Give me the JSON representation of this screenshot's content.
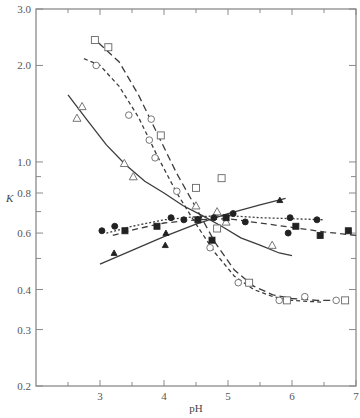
{
  "chart_data": {
    "type": "scatter",
    "title": "",
    "xlabel": "pH",
    "ylabel": "K",
    "xlim": [
      2,
      7
    ],
    "ylim": [
      0.2,
      3.0
    ],
    "yscale": "log",
    "grid": false,
    "legend": "none",
    "x_ticks": [
      3,
      4,
      5,
      6,
      7
    ],
    "x_minor_ticks": [
      2.5,
      3.5,
      4.5,
      5.5,
      6.5
    ],
    "y_ticks": [
      0.2,
      0.3,
      0.4,
      0.6,
      0.8,
      1.0,
      2.0,
      3.0
    ],
    "y_tick_labels": [
      "0.2",
      "0.3",
      "0.4",
      "0.6",
      "0.8",
      "1.0",
      "2.0",
      "3.0"
    ],
    "y_minor_ticks": [
      0.5,
      0.7,
      0.9
    ],
    "series": [
      {
        "name": "open-squares",
        "marker": "square-open",
        "points": [
          [
            2.92,
            2.4
          ],
          [
            3.13,
            2.28
          ],
          [
            3.95,
            1.21
          ],
          [
            4.5,
            0.83
          ],
          [
            4.9,
            0.89
          ],
          [
            4.83,
            0.62
          ],
          [
            5.33,
            0.42
          ],
          [
            5.92,
            0.37
          ],
          [
            6.83,
            0.37
          ]
        ]
      },
      {
        "name": "open-circles",
        "marker": "circle-open",
        "points": [
          [
            2.94,
            2.0
          ],
          [
            3.45,
            1.4
          ],
          [
            3.8,
            1.36
          ],
          [
            3.77,
            1.17
          ],
          [
            3.86,
            1.03
          ],
          [
            4.2,
            0.81
          ],
          [
            4.72,
            0.54
          ],
          [
            5.16,
            0.42
          ],
          [
            5.8,
            0.37
          ],
          [
            6.2,
            0.38
          ],
          [
            6.69,
            0.37
          ]
        ]
      },
      {
        "name": "open-triangles",
        "marker": "triangle-open",
        "points": [
          [
            2.64,
            1.37
          ],
          [
            2.72,
            1.49
          ],
          [
            3.38,
            0.99
          ],
          [
            3.52,
            0.9
          ],
          [
            4.5,
            0.73
          ],
          [
            4.83,
            0.7
          ],
          [
            4.97,
            0.65
          ],
          [
            5.69,
            0.55
          ]
        ]
      },
      {
        "name": "filled-circles",
        "marker": "circle-filled",
        "points": [
          [
            3.03,
            0.61
          ],
          [
            3.23,
            0.63
          ],
          [
            4.11,
            0.67
          ],
          [
            4.31,
            0.66
          ],
          [
            4.78,
            0.67
          ],
          [
            5.08,
            0.69
          ],
          [
            5.27,
            0.65
          ],
          [
            5.97,
            0.67
          ],
          [
            6.39,
            0.66
          ],
          [
            5.94,
            0.6
          ]
        ]
      },
      {
        "name": "filled-squares",
        "marker": "square-filled",
        "points": [
          [
            3.39,
            0.61
          ],
          [
            3.89,
            0.63
          ],
          [
            4.53,
            0.66
          ],
          [
            4.75,
            0.57
          ],
          [
            4.97,
            0.67
          ],
          [
            6.06,
            0.63
          ],
          [
            6.44,
            0.59
          ],
          [
            6.88,
            0.61
          ]
        ]
      },
      {
        "name": "filled-triangles",
        "marker": "triangle-filled",
        "points": [
          [
            3.22,
            0.52
          ],
          [
            4.03,
            0.6
          ],
          [
            4.02,
            0.55
          ],
          [
            5.81,
            0.76
          ]
        ]
      }
    ],
    "curves": [
      {
        "name": "fit-open-squares",
        "style": "long-dash",
        "points": [
          [
            2.98,
            2.35
          ],
          [
            3.3,
            2.05
          ],
          [
            3.6,
            1.62
          ],
          [
            3.9,
            1.22
          ],
          [
            4.2,
            0.92
          ],
          [
            4.5,
            0.72
          ],
          [
            4.8,
            0.56
          ],
          [
            5.1,
            0.46
          ],
          [
            5.4,
            0.41
          ],
          [
            5.7,
            0.385
          ],
          [
            6.0,
            0.375
          ],
          [
            6.4,
            0.37
          ],
          [
            6.7,
            0.37
          ]
        ]
      },
      {
        "name": "fit-open-circles",
        "style": "short-dash",
        "points": [
          [
            2.75,
            2.1
          ],
          [
            3.0,
            2.0
          ],
          [
            3.3,
            1.72
          ],
          [
            3.6,
            1.38
          ],
          [
            3.9,
            1.04
          ],
          [
            4.2,
            0.8
          ],
          [
            4.5,
            0.64
          ],
          [
            4.8,
            0.52
          ],
          [
            5.1,
            0.44
          ],
          [
            5.4,
            0.4
          ],
          [
            5.7,
            0.38
          ],
          [
            6.0,
            0.37
          ],
          [
            6.5,
            0.365
          ]
        ]
      },
      {
        "name": "fit-open-triangles",
        "style": "solid",
        "points": [
          [
            2.5,
            1.62
          ],
          [
            2.8,
            1.35
          ],
          [
            3.1,
            1.13
          ],
          [
            3.4,
            0.98
          ],
          [
            3.7,
            0.87
          ],
          [
            4.0,
            0.8
          ],
          [
            4.3,
            0.73
          ],
          [
            4.6,
            0.68
          ],
          [
            4.9,
            0.63
          ],
          [
            5.2,
            0.58
          ],
          [
            5.5,
            0.55
          ],
          [
            5.8,
            0.52
          ],
          [
            6.0,
            0.51
          ]
        ]
      },
      {
        "name": "fit-filled-circles",
        "style": "dotted",
        "points": [
          [
            3.1,
            0.6
          ],
          [
            3.5,
            0.63
          ],
          [
            4.0,
            0.66
          ],
          [
            4.5,
            0.675
          ],
          [
            5.0,
            0.68
          ],
          [
            5.5,
            0.67
          ],
          [
            6.0,
            0.665
          ],
          [
            6.5,
            0.66
          ]
        ]
      },
      {
        "name": "fit-filled-squares",
        "style": "dash",
        "points": [
          [
            3.2,
            0.59
          ],
          [
            3.6,
            0.62
          ],
          [
            4.0,
            0.645
          ],
          [
            4.5,
            0.66
          ],
          [
            5.0,
            0.665
          ],
          [
            5.5,
            0.645
          ],
          [
            6.0,
            0.625
          ],
          [
            6.5,
            0.605
          ],
          [
            7.0,
            0.59
          ]
        ]
      },
      {
        "name": "fit-filled-triangles",
        "style": "solid",
        "points": [
          [
            3.0,
            0.48
          ],
          [
            3.5,
            0.53
          ],
          [
            4.0,
            0.585
          ],
          [
            4.5,
            0.64
          ],
          [
            5.0,
            0.69
          ],
          [
            5.5,
            0.735
          ],
          [
            5.9,
            0.77
          ]
        ]
      }
    ]
  }
}
